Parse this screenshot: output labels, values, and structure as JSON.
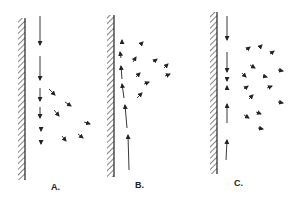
{
  "figure": {
    "panels": [
      {
        "id": "A",
        "label": "A.",
        "label_pos": [
          51,
          182
        ],
        "wall": {
          "x": 18,
          "y1": 18,
          "y2": 180
        },
        "arrows": [
          [
            40,
            16,
            40,
            45
          ],
          [
            40,
            56,
            40,
            80
          ],
          [
            40,
            88,
            40,
            101
          ],
          [
            40,
            107,
            40,
            118
          ],
          [
            41,
            127,
            41,
            131
          ],
          [
            41,
            141,
            41,
            144
          ],
          [
            49,
            89,
            55,
            95
          ],
          [
            65,
            102,
            71,
            106
          ],
          [
            54,
            110,
            59,
            116
          ],
          [
            84,
            122,
            90,
            124
          ],
          [
            78,
            134,
            83,
            138
          ],
          [
            62,
            136,
            66,
            141
          ]
        ]
      },
      {
        "id": "B",
        "label": "B.",
        "label_pos": [
          135,
          180
        ],
        "wall": {
          "x": 107,
          "y1": 15,
          "y2": 177
        },
        "arrows": [
          [
            129,
            170,
            128,
            135
          ],
          [
            127,
            128,
            125,
            105
          ],
          [
            124,
            98,
            122,
            84
          ],
          [
            122,
            79,
            121,
            66
          ],
          [
            121,
            58,
            120,
            52
          ],
          [
            122,
            44,
            122,
            40
          ],
          [
            140,
            45,
            143,
            42
          ],
          [
            133,
            62,
            136,
            57
          ],
          [
            137,
            98,
            142,
            93
          ],
          [
            136,
            77,
            140,
            73
          ],
          [
            144,
            84,
            149,
            82
          ],
          [
            153,
            62,
            157,
            59
          ],
          [
            164,
            68,
            168,
            64
          ],
          [
            165,
            76,
            170,
            74
          ]
        ]
      },
      {
        "id": "C",
        "label": "C.",
        "label_pos": [
          234,
          178
        ],
        "wall": {
          "x": 210,
          "y1": 12,
          "y2": 174
        },
        "arrows": [
          [
            227,
            16,
            227,
            40
          ],
          [
            227,
            52,
            227,
            72
          ],
          [
            227,
            77,
            227,
            81
          ],
          [
            227,
            90,
            227,
            86
          ],
          [
            227,
            123,
            227,
            104
          ],
          [
            226,
            160,
            227,
            140
          ],
          [
            246,
            50,
            250,
            47
          ],
          [
            259,
            48,
            262,
            45
          ],
          [
            270,
            54,
            274,
            51
          ],
          [
            250,
            65,
            255,
            68
          ],
          [
            242,
            73,
            246,
            77
          ],
          [
            263,
            76,
            267,
            77
          ],
          [
            278,
            70,
            283,
            71
          ],
          [
            244,
            89,
            248,
            86
          ],
          [
            267,
            88,
            272,
            86
          ],
          [
            249,
            99,
            253,
            95
          ],
          [
            278,
            102,
            283,
            103
          ],
          [
            244,
            115,
            249,
            118
          ],
          [
            256,
            112,
            261,
            114
          ],
          [
            258,
            128,
            263,
            129
          ]
        ]
      }
    ]
  }
}
